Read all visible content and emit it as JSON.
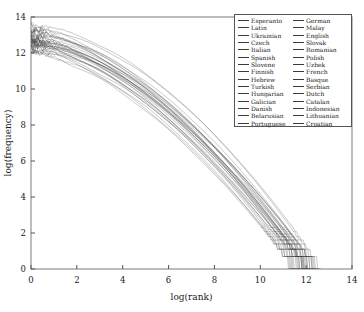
{
  "chart_data": {
    "type": "line",
    "title": "",
    "xlabel": "log(rank)",
    "ylabel": "log(frequency)",
    "xlim": [
      0,
      14
    ],
    "ylim": [
      0,
      14
    ],
    "xticks": [
      0,
      2,
      4,
      6,
      8,
      10,
      12,
      14
    ],
    "yticks": [
      0,
      2,
      4,
      6,
      8,
      10,
      12,
      14
    ],
    "xticklabels": [
      "0",
      "2",
      "4",
      "6",
      "8",
      "10",
      "12",
      "14"
    ],
    "yticklabels": [
      "0",
      "2",
      "4",
      "6",
      "8",
      "10",
      "12",
      "14"
    ],
    "grid": false,
    "legend_position": "upper right",
    "legend_columns": 2,
    "line_color": "#3a3a3a",
    "frame_color": "#888888",
    "series": [
      {
        "name": "Esperanto",
        "y0": 12.35,
        "xend": 11.55
      },
      {
        "name": "Latin",
        "y0": 12.2,
        "xend": 11.7
      },
      {
        "name": "Ukrainian",
        "y0": 12.55,
        "xend": 12.05
      },
      {
        "name": "Czech",
        "y0": 12.7,
        "xend": 12.25
      },
      {
        "name": "Italian",
        "y0": 13.05,
        "xend": 12.1
      },
      {
        "name": "Spanish",
        "y0": 13.35,
        "xend": 12.35
      },
      {
        "name": "Slovene",
        "y0": 12.45,
        "xend": 11.85
      },
      {
        "name": "Finnish",
        "y0": 12.3,
        "xend": 12.55
      },
      {
        "name": "Hebrew",
        "y0": 12.6,
        "xend": 12.15
      },
      {
        "name": "Turkish",
        "y0": 12.5,
        "xend": 12.45
      },
      {
        "name": "Hungarian",
        "y0": 12.4,
        "xend": 12.4
      },
      {
        "name": "Galician",
        "y0": 12.15,
        "xend": 11.6
      },
      {
        "name": "Danish",
        "y0": 12.6,
        "xend": 11.9
      },
      {
        "name": "Belarusian",
        "y0": 11.95,
        "xend": 11.5
      },
      {
        "name": "Portuguese",
        "y0": 13.1,
        "xend": 12.2
      },
      {
        "name": "German",
        "y0": 13.3,
        "xend": 12.7
      },
      {
        "name": "Malay",
        "y0": 12.75,
        "xend": 11.65
      },
      {
        "name": "English",
        "y0": 13.5,
        "xend": 12.6
      },
      {
        "name": "Slovak",
        "y0": 12.45,
        "xend": 12.0
      },
      {
        "name": "Romanian",
        "y0": 12.85,
        "xend": 12.1
      },
      {
        "name": "Polish",
        "y0": 13.0,
        "xend": 12.45
      },
      {
        "name": "Uzbek",
        "y0": 11.9,
        "xend": 11.45
      },
      {
        "name": "French",
        "y0": 13.25,
        "xend": 12.3
      },
      {
        "name": "Basque",
        "y0": 12.1,
        "xend": 11.95
      },
      {
        "name": "Serbian",
        "y0": 12.65,
        "xend": 12.05
      },
      {
        "name": "Dutch",
        "y0": 13.15,
        "xend": 12.5
      },
      {
        "name": "Catalan",
        "y0": 12.8,
        "xend": 12.0
      },
      {
        "name": "Indonesian",
        "y0": 12.9,
        "xend": 11.75
      },
      {
        "name": "Lithuanian",
        "y0": 12.25,
        "xend": 11.9
      },
      {
        "name": "Croatian",
        "y0": 12.55,
        "xend": 12.15
      }
    ]
  },
  "legend": {
    "columns": [
      [
        "Esperanto",
        "Latin",
        "Ukrainian",
        "Czech",
        "Italian",
        "Spanish",
        "Slovene",
        "Finnish",
        "Hebrew",
        "Turkish",
        "Hungarian",
        "Galician",
        "Danish",
        "Belarusian",
        "Portuguese"
      ],
      [
        "German",
        "Malay",
        "English",
        "Slovak",
        "Romanian",
        "Polish",
        "Uzbek",
        "French",
        "Basque",
        "Serbian",
        "Dutch",
        "Catalan",
        "Indonesian",
        "Lithuanian",
        "Croatian"
      ]
    ]
  }
}
